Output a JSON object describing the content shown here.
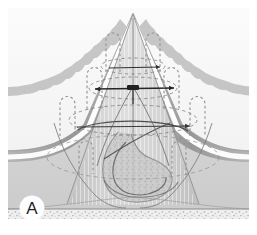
{
  "figure": {
    "panel_label": "A",
    "caption_visible": false,
    "kind": "anatomical-cross-section-illustration",
    "style": "grayscale-medical-diagram",
    "width": 257,
    "height": 235
  },
  "colors": {
    "background": "#ffffff",
    "canvas": "#f7f7f7",
    "outer_tissue_light": "#d9d9d9",
    "outer_tissue_mid": "#cfcfcf",
    "serosa_dark": "#a8a8a8",
    "serosa_darker": "#9a9a9a",
    "white_plane": "#fdfdfd",
    "cone_fill": "#cdcdcd",
    "cone_fill_light": "#dcdcdc",
    "inner_mass": "#c6c6c6",
    "speckle_band": "#ededed",
    "speckle_dot": "#b6b6b6",
    "line_dark": "#3a3a3a",
    "line_mid": "#6e6e6e",
    "dashed_marker": "#8a8a8a",
    "panel_letter": "#1d1d1d",
    "panel_letter_bg": "#ffffff"
  },
  "panel_badge": {
    "label": "A",
    "shape": "circle",
    "cx": 32,
    "cy": 208,
    "r": 12
  },
  "annotations": {
    "suture_markers_label": "dashed U-shaped suture markers",
    "suture_markers_count": 8,
    "suture_markers": [
      {
        "id": "suture-left-outer",
        "x": 60,
        "y": 96,
        "w": 15,
        "h": 40
      },
      {
        "id": "suture-left-mid",
        "x": 87,
        "y": 67,
        "w": 15,
        "h": 42
      },
      {
        "id": "suture-left-inner",
        "x": 106,
        "y": 32,
        "w": 14,
        "h": 40
      },
      {
        "id": "suture-left-far",
        "x": 79,
        "y": 140,
        "w": 14,
        "h": 34
      },
      {
        "id": "suture-right-inner",
        "x": 160,
        "y": 32,
        "w": 14,
        "h": 40
      },
      {
        "id": "suture-right-mid",
        "x": 180,
        "y": 66,
        "w": 15,
        "h": 42
      },
      {
        "id": "suture-right-outer",
        "x": 205,
        "y": 96,
        "w": 15,
        "h": 40
      },
      {
        "id": "suture-right-far",
        "x": 176,
        "y": 140,
        "w": 14,
        "h": 34
      }
    ],
    "center_clip_label": "central dark clip marker",
    "center_clip": {
      "x": 133,
      "y": 90
    },
    "arrow_lines_label": "horizontal traction arrow lines",
    "dashed_ellipses_label": "dashed elliptical contour rings",
    "apex": {
      "x": 133,
      "y": 13
    },
    "base_line_y": 208
  },
  "structures": [
    {
      "name": "outer-tissue-body",
      "description": "light gray peaked tissue body"
    },
    {
      "name": "serosa-layer",
      "description": "darker gray scalloped serosal band"
    },
    {
      "name": "white-cleavage-plane",
      "description": "white separation plane along tissue edge"
    },
    {
      "name": "central-cone",
      "description": "central conical tented structure"
    },
    {
      "name": "inner-mass",
      "description": "mottled inner mass at cone base"
    },
    {
      "name": "speckled-base",
      "description": "stippled horizontal base band"
    }
  ]
}
